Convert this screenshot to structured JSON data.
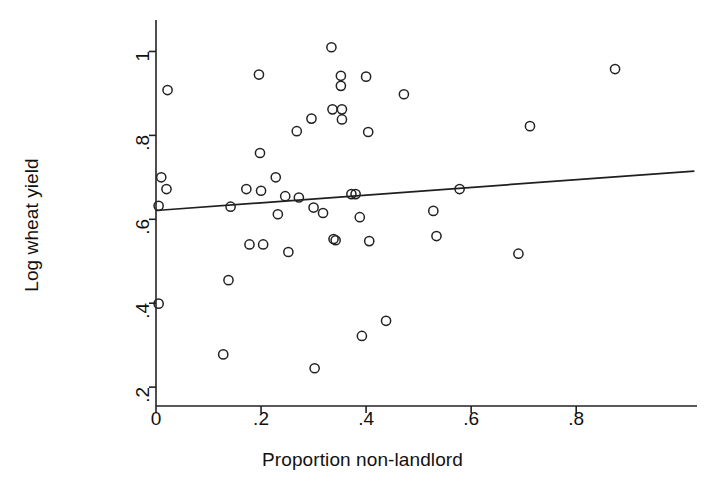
{
  "chart_data": {
    "type": "scatter",
    "title": "",
    "xlabel": "Proportion non-landlord",
    "ylabel": "Log wheat yield",
    "xlim": [
      0,
      1.03
    ],
    "ylim": [
      0.155,
      1.075
    ],
    "xticks": [
      0,
      0.2,
      0.4,
      0.6,
      0.8
    ],
    "xticklabels": [
      "0",
      ".2",
      ".4",
      ".6",
      ".8"
    ],
    "yticks": [
      0.2,
      0.4,
      0.6,
      0.8,
      1.0
    ],
    "yticklabels": [
      ".2",
      ".4",
      ".6",
      ".8",
      "1"
    ],
    "grid": false,
    "legend": false,
    "marker": "open-circle",
    "marker_color": "#222222",
    "points": [
      [
        0.005,
        0.632
      ],
      [
        0.01,
        0.7
      ],
      [
        0.02,
        0.672
      ],
      [
        0.022,
        0.908
      ],
      [
        0.005,
        0.399
      ],
      [
        0.128,
        0.278
      ],
      [
        0.138,
        0.455
      ],
      [
        0.142,
        0.63
      ],
      [
        0.172,
        0.672
      ],
      [
        0.178,
        0.54
      ],
      [
        0.196,
        0.945
      ],
      [
        0.198,
        0.758
      ],
      [
        0.2,
        0.668
      ],
      [
        0.204,
        0.54
      ],
      [
        0.228,
        0.7
      ],
      [
        0.232,
        0.612
      ],
      [
        0.246,
        0.655
      ],
      [
        0.252,
        0.522
      ],
      [
        0.268,
        0.81
      ],
      [
        0.272,
        0.652
      ],
      [
        0.296,
        0.84
      ],
      [
        0.3,
        0.628
      ],
      [
        0.302,
        0.245
      ],
      [
        0.318,
        0.615
      ],
      [
        0.334,
        1.01
      ],
      [
        0.336,
        0.862
      ],
      [
        0.338,
        0.553
      ],
      [
        0.342,
        0.55
      ],
      [
        0.352,
        0.942
      ],
      [
        0.352,
        0.918
      ],
      [
        0.354,
        0.862
      ],
      [
        0.354,
        0.838
      ],
      [
        0.372,
        0.66
      ],
      [
        0.38,
        0.66
      ],
      [
        0.388,
        0.605
      ],
      [
        0.392,
        0.322
      ],
      [
        0.4,
        0.94
      ],
      [
        0.404,
        0.808
      ],
      [
        0.406,
        0.548
      ],
      [
        0.438,
        0.358
      ],
      [
        0.472,
        0.898
      ],
      [
        0.528,
        0.62
      ],
      [
        0.534,
        0.56
      ],
      [
        0.578,
        0.672
      ],
      [
        0.69,
        0.518
      ],
      [
        0.712,
        0.822
      ],
      [
        0.874,
        0.958
      ]
    ],
    "fit_line": {
      "label": "linear fit",
      "x": [
        0.0,
        1.025
      ],
      "y": [
        0.621,
        0.715
      ]
    }
  }
}
